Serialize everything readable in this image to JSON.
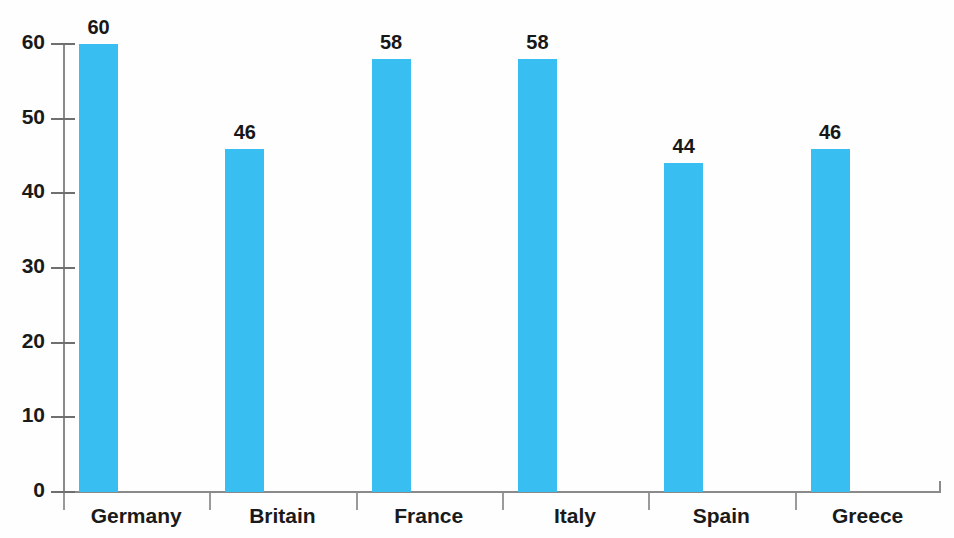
{
  "chart_data": {
    "type": "bar",
    "title": "",
    "xlabel": "",
    "ylabel": "",
    "categories": [
      "Germany",
      "Britain",
      "France",
      "Italy",
      "Spain",
      "Greece"
    ],
    "values": [
      60,
      46,
      58,
      58,
      44,
      46
    ],
    "value_labels": [
      "60",
      "46",
      "58",
      "58",
      "44",
      "46"
    ],
    "ylim": [
      0,
      60
    ],
    "ytick_labels": [
      "60",
      "50",
      "40",
      "30",
      "20",
      "10",
      "0"
    ],
    "ytick_values": [
      60,
      50,
      40,
      30,
      20,
      10,
      0
    ],
    "grid": false,
    "legend": "none",
    "bar_color": "#38bef0",
    "axis_color": "#8a8a8a",
    "text_color": "#1a1a1a",
    "background_color": "#fefefe"
  }
}
